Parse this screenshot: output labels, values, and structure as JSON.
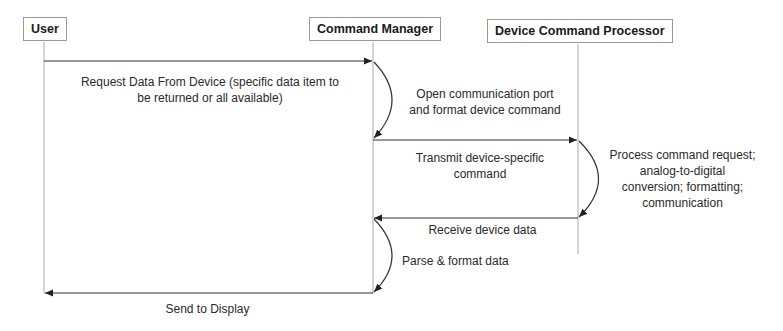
{
  "actors": [
    {
      "name": "User"
    },
    {
      "name": "Command Manager"
    },
    {
      "name": "Device Command Processor"
    }
  ],
  "messages": [
    {
      "from": "User",
      "to": "Command Manager",
      "label": "Request Data From Device (specific data item to be returned or all available)",
      "line1": "Request Data From Device (specific data item to",
      "line2": "be returned or all available)"
    },
    {
      "self": "Command Manager",
      "line1": "Open communication port",
      "line2": "and format device command"
    },
    {
      "from": "Command Manager",
      "to": "Device Command Processor",
      "line1": "Transmit device-specific",
      "line2": "command"
    },
    {
      "self": "Device Command Processor",
      "line1": "Process command request;",
      "line2": "analog-to-digital",
      "line3": "conversion; formatting;",
      "line4": "communication"
    },
    {
      "from": "Device Command Processor",
      "to": "Command Manager",
      "line1": "Receive device data"
    },
    {
      "self": "Command Manager",
      "line1": "Parse & format data"
    },
    {
      "from": "Command Manager",
      "to": "User",
      "line1": "Send to Display"
    }
  ],
  "colors": {
    "line": "#333333",
    "lifeline": "#aaaaaa",
    "box_border": "#999999"
  }
}
